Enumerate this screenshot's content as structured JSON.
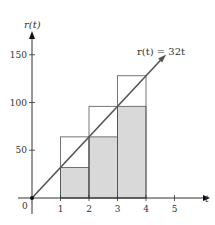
{
  "chart_data": {
    "type": "bar",
    "title": "",
    "xlabel": "t",
    "ylabel": "r(t)",
    "xlim": [
      0,
      5.8
    ],
    "ylim": [
      0,
      170
    ],
    "x_ticks": [
      1,
      2,
      3,
      4,
      5
    ],
    "y_ticks": [
      50,
      100,
      150
    ],
    "origin_label": "0",
    "grid": false,
    "legend": null,
    "line": {
      "name": "r(t) = 32t",
      "slope": 32,
      "x": [
        0,
        4.6
      ],
      "y": [
        0,
        147.2
      ]
    },
    "annotation": "r(t) = 32t",
    "series": [
      {
        "name": "upper sum (unshaded outline)",
        "intervals": [
          [
            1,
            2
          ],
          [
            2,
            3
          ],
          [
            3,
            4
          ]
        ],
        "values": [
          64,
          96,
          128
        ]
      },
      {
        "name": "lower sum (shaded)",
        "intervals": [
          [
            1,
            2
          ],
          [
            2,
            3
          ],
          [
            3,
            4
          ]
        ],
        "values": [
          32,
          64,
          96
        ]
      }
    ],
    "categories": [
      "[1,2]",
      "[2,3]",
      "[3,4]"
    ],
    "colors": {
      "axis": "#333333",
      "line": "#555555",
      "shade": "#d9d9d9",
      "outline": "#555555"
    }
  },
  "labels": {
    "y_axis": "r(t)",
    "x_axis": "t",
    "origin": "0",
    "x_ticks": [
      "1",
      "2",
      "3",
      "4",
      "5"
    ],
    "y_ticks": [
      "50",
      "100",
      "150"
    ],
    "annotation": "r(t) = 32t"
  }
}
